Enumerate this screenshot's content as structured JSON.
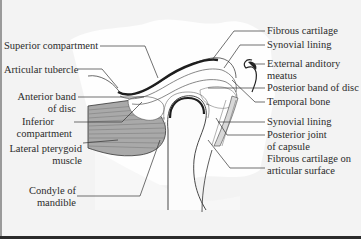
{
  "diagram": {
    "colors": {
      "background": "#f3f3f3",
      "cloud": "#ffffff",
      "muscle": "#a8a8a8",
      "muscle_stripe": "#8a8a8a",
      "cartilage_dark": "#2a2a2a",
      "line": "#333333",
      "text": "#2b2b2b"
    },
    "labels_left": [
      {
        "id": "superior-compartment",
        "lines": [
          "Superior compartment"
        ]
      },
      {
        "id": "articular-tubercle",
        "lines": [
          "Articular tubercle"
        ]
      },
      {
        "id": "anterior-band-of-disc",
        "lines": [
          "Anterior band",
          "of disc"
        ]
      },
      {
        "id": "inferior-compartment",
        "lines": [
          "Inferior",
          "compartment"
        ]
      },
      {
        "id": "lateral-pterygoid-muscle",
        "lines": [
          "Lateral pterygoid",
          "muscle"
        ]
      },
      {
        "id": "condyle-of-mandible",
        "lines": [
          "Condyle of",
          "mandible"
        ]
      }
    ],
    "labels_right": [
      {
        "id": "fibrous-cartilage",
        "lines": [
          "Fibrous cartilage"
        ]
      },
      {
        "id": "synovial-lining-upper",
        "lines": [
          "Synovial lining"
        ]
      },
      {
        "id": "external-auditory-meatus",
        "lines": [
          "External anditory",
          "meatus"
        ]
      },
      {
        "id": "posterior-band-of-disc",
        "lines": [
          "Posterior band of disc"
        ]
      },
      {
        "id": "temporal-bone",
        "lines": [
          "Temporal bone"
        ]
      },
      {
        "id": "synovial-lining-lower",
        "lines": [
          "Synovial lining"
        ]
      },
      {
        "id": "posterior-joint-of-capsule",
        "lines": [
          "Posterior joint",
          "of capsule"
        ]
      },
      {
        "id": "fibrous-cartilage-articular",
        "lines": [
          "Fibrous cartilage on",
          "articular surface"
        ]
      }
    ]
  }
}
